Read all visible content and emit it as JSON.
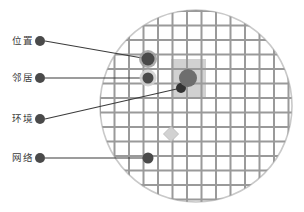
{
  "figure": {
    "title": "",
    "background_color": "#ffffff",
    "canvas": {
      "width": 304,
      "height": 212
    }
  },
  "colors": {
    "grid_line": "#9a9a9a",
    "grid_line_light": "#bdbdbd",
    "circle_outline": "#c9c9c9",
    "circle_fill": "#ffffff",
    "highlight_region": "#c2c2c2",
    "node_dark": "#4a4a4a",
    "node_mid": "#6e6e6e",
    "node_light": "#d2d2d2",
    "node_halo": "#b5b5b5",
    "leader_line": "#3b3b3b",
    "label_text": "#3b3b3b"
  },
  "legend": {
    "items": [
      {
        "id": "position",
        "label": "位置",
        "label_x": 12,
        "label_y": 41,
        "marker_x": 40,
        "marker_y": 41,
        "marker_r": 5.0,
        "marker_color": "#4a4a4a",
        "target_x": 148,
        "target_y": 59
      },
      {
        "id": "neighbor",
        "label": "邻居",
        "label_x": 12,
        "label_y": 78,
        "marker_x": 40,
        "marker_y": 78,
        "marker_r": 5.0,
        "marker_color": "#4a4a4a",
        "target_x": 148,
        "target_y": 78
      },
      {
        "id": "environment",
        "label": "环境",
        "label_x": 12,
        "label_y": 119,
        "marker_x": 40,
        "marker_y": 119,
        "marker_r": 5.0,
        "marker_color": "#4a4a4a",
        "target_x": 181,
        "target_y": 88
      },
      {
        "id": "network",
        "label": "网络",
        "label_x": 12,
        "label_y": 158,
        "marker_x": 40,
        "marker_y": 158,
        "marker_r": 5.0,
        "marker_color": "#4a4a4a",
        "target_x": 148,
        "target_y": 158
      }
    ]
  },
  "chart_data": {
    "type": "diagram",
    "title": "",
    "circle": {
      "cx": 196,
      "cy": 106,
      "r": 96,
      "stroke": "#c9c9c9",
      "stroke_width": 1.6
    },
    "grid": {
      "spacing": 14.5,
      "origin_x": 100,
      "origin_y": 11,
      "columns": 14,
      "rows": 14,
      "line_color": "#9a9a9a",
      "line_width": 2.0,
      "visible": true
    },
    "highlight_region": {
      "x": 171,
      "y": 59,
      "width": 35,
      "height": 39,
      "fill": "#c2c2c2",
      "opacity": 0.75,
      "label": "neighborhood-window"
    },
    "nodes": [
      {
        "id": "position-node",
        "x": 148,
        "y": 59,
        "r": 6.5,
        "fill": "#4a4a4a",
        "halo_r": 9.0,
        "halo_fill": "#9e9e9e",
        "shape": "circle"
      },
      {
        "id": "neighbor-node",
        "x": 148,
        "y": 78,
        "r": 5.5,
        "fill": "#4a4a4a",
        "halo_r": 8.5,
        "halo_fill": "#cfcfcf",
        "shape": "circle"
      },
      {
        "id": "environment-node",
        "x": 181,
        "y": 88,
        "r": 5.0,
        "fill": "#333333",
        "halo_r": 0,
        "halo_fill": "none",
        "shape": "circle"
      },
      {
        "id": "center-node",
        "x": 188,
        "y": 78,
        "r": 9.0,
        "fill": "#6e6e6e",
        "halo_r": 0,
        "halo_fill": "none",
        "shape": "circle"
      },
      {
        "id": "light-node",
        "x": 171,
        "y": 134,
        "r": 7.5,
        "fill": "#d2d2d2",
        "halo_r": 0,
        "halo_fill": "none",
        "shape": "diamond"
      },
      {
        "id": "network-node",
        "x": 148,
        "y": 158,
        "r": 5.5,
        "fill": "#4a4a4a",
        "halo_r": 0,
        "halo_fill": "none",
        "shape": "circle"
      }
    ]
  }
}
